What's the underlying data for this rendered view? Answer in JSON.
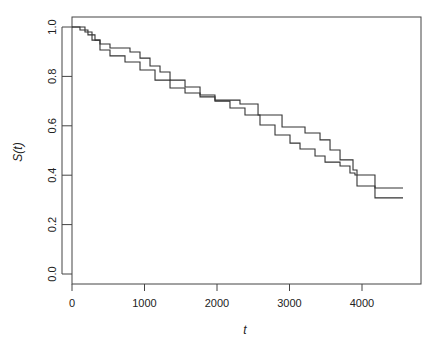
{
  "chart_data": {
    "type": "line",
    "subtype": "step (Kaplan-Meier survival curves)",
    "title": "",
    "xlabel": "t",
    "ylabel": "S(t)",
    "xlim": [
      0,
      4820
    ],
    "ylim": [
      -0.04,
      1.04
    ],
    "x_ticks": [
      0,
      1000,
      2000,
      3000,
      4000
    ],
    "x_tick_labels": [
      "0",
      "1000",
      "2000",
      "3000",
      "4000"
    ],
    "y_ticks": [
      0.0,
      0.2,
      0.4,
      0.6,
      0.8,
      1.0
    ],
    "y_tick_labels": [
      "0.0",
      "0.2",
      "0.4",
      "0.6",
      "0.8",
      "1.0"
    ],
    "grid": false,
    "legend": null,
    "line_color": "#333333",
    "series": [
      {
        "name": "curve-1",
        "t": [
          0,
          110,
          220,
          317,
          386,
          524,
          800,
          938,
          1076,
          1214,
          1352,
          1559,
          1766,
          1972,
          2317,
          2510,
          2566,
          2841,
          2897,
          3145,
          3214,
          3421,
          3559,
          3697,
          3876,
          3931,
          4138,
          4179,
          4566
        ],
        "S": [
          1.0,
          0.988,
          0.968,
          0.947,
          0.931,
          0.915,
          0.899,
          0.874,
          0.842,
          0.818,
          0.785,
          0.757,
          0.725,
          0.704,
          0.688,
          0.688,
          0.644,
          0.644,
          0.595,
          0.595,
          0.571,
          0.543,
          0.502,
          0.462,
          0.421,
          0.356,
          0.356,
          0.348,
          0.348
        ]
      },
      {
        "name": "curve-2",
        "t": [
          0,
          179,
          276,
          386,
          524,
          731,
          938,
          1145,
          1352,
          1559,
          1766,
          1972,
          2179,
          2386,
          2593,
          2800,
          3007,
          3145,
          3352,
          3490,
          3697,
          3834,
          3903,
          4138,
          4179,
          4566
        ],
        "S": [
          1.0,
          0.98,
          0.947,
          0.907,
          0.883,
          0.858,
          0.826,
          0.785,
          0.753,
          0.733,
          0.717,
          0.7,
          0.672,
          0.644,
          0.603,
          0.563,
          0.53,
          0.506,
          0.478,
          0.453,
          0.437,
          0.409,
          0.401,
          0.401,
          0.308,
          0.308
        ]
      }
    ]
  }
}
